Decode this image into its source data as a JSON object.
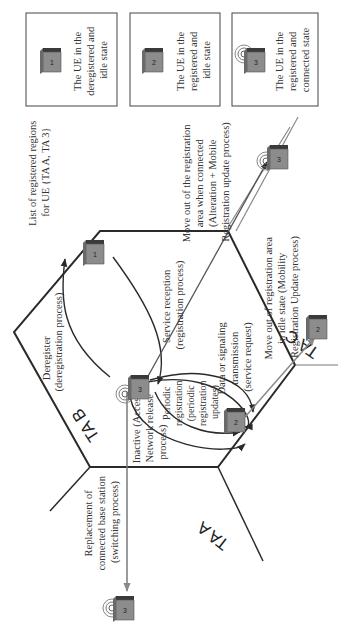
{
  "legend": {
    "title_lines": [
      "List of registered regions",
      "for UE {TA A, TA 3}"
    ],
    "items": [
      {
        "icon_number": "1",
        "signal": false,
        "lines": [
          "The UE in the",
          "deregistered and",
          "idle state"
        ]
      },
      {
        "icon_number": "2",
        "signal": false,
        "lines": [
          "The UE in the",
          "registered and",
          "idle state"
        ]
      },
      {
        "icon_number": "3",
        "signal": true,
        "lines": [
          "The UE in the",
          "registered and",
          "connected state"
        ]
      }
    ]
  },
  "areas": {
    "ta_a": "TA A",
    "ta_b": "TA B",
    "ta_c": "TA C"
  },
  "transitions": {
    "service_reception": [
      "Service reception",
      "(registration process)"
    ],
    "deregister": [
      "Deregister",
      "(deregistration process)"
    ],
    "data_signaling": [
      "Data or signaling",
      "transmission",
      "(service request)"
    ],
    "periodic": [
      "Periodic",
      "registration",
      "(periodic",
      "registration",
      "updates)"
    ],
    "inactive": [
      "Inactive (Access",
      "Network release",
      "process)"
    ],
    "replacement": [
      "Replacement of",
      "connected base station",
      "(switching process)"
    ],
    "move_idle": [
      "Move out of registration area",
      "in idle state (Mobility",
      "Registration Update process)"
    ],
    "move_connected": [
      "Move out of the registration",
      "area when connected",
      "(Alteration + Mobile",
      "Registration update process)"
    ]
  },
  "ue_nodes": [
    {
      "id": "ue-1-center",
      "number": "1",
      "signal": false
    },
    {
      "id": "ue-3-center",
      "number": "3",
      "signal": true
    },
    {
      "id": "ue-2-center",
      "number": "2",
      "signal": false
    },
    {
      "id": "ue-2-tac",
      "number": "2",
      "signal": false
    },
    {
      "id": "ue-3-tac",
      "number": "3",
      "signal": true
    },
    {
      "id": "ue-3-outside",
      "number": "3",
      "signal": true
    }
  ],
  "colors": {
    "line": "#2a2a2a",
    "arrow_gray": "#8a8a8a",
    "phone_top": "#3a3a3a",
    "phone_body": "#8c8c8c",
    "text": "#333333"
  }
}
